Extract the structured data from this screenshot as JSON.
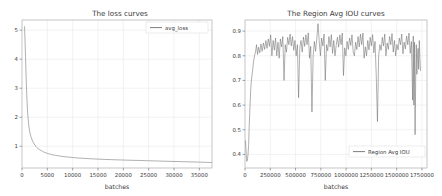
{
  "figure": {
    "background_color": "#ffffff",
    "line_color": "#6e6e6e",
    "grid_color": "#e9e9e9",
    "text_color": "#3a3a3a"
  },
  "chart_data": [
    {
      "type": "line",
      "panel": "left",
      "title": "The loss curves",
      "xlabel": "batches",
      "ylabel": "",
      "xlim": [
        0,
        37500
      ],
      "ylim": [
        0.25,
        5.35
      ],
      "grid": true,
      "legend_position": "upper right",
      "xticks": [
        0,
        5000,
        10000,
        15000,
        20000,
        25000,
        30000,
        35000
      ],
      "xticklabels": [
        "0",
        "5000",
        "10000",
        "15000",
        "20000",
        "25000",
        "30000",
        "35000"
      ],
      "yticks": [
        1,
        2,
        3,
        4,
        5
      ],
      "yticklabels": [
        "1",
        "2",
        "3",
        "4",
        "5"
      ],
      "series": [
        {
          "name": "avg_loss",
          "color": "#6e6e6e",
          "x": [
            500,
            620,
            700,
            780,
            860,
            940,
            1020,
            1100,
            1200,
            1300,
            1400,
            1500,
            1650,
            1800,
            1950,
            2100,
            2300,
            2500,
            2700,
            2900,
            3100,
            3400,
            3700,
            4000,
            4300,
            4600,
            5000,
            5400,
            5800,
            6200,
            6600,
            7000,
            7500,
            8000,
            8500,
            9000,
            9500,
            10000,
            10600,
            11200,
            11800,
            12400,
            13000,
            13700,
            14400,
            15100,
            15800,
            16500,
            17300,
            18100,
            18900,
            19700,
            20500,
            21400,
            22300,
            23200,
            24100,
            25000,
            26000,
            27000,
            28000,
            29000,
            30000,
            31000,
            32000,
            33000,
            34000,
            35000,
            36000,
            37000,
            37400
          ],
          "values": [
            5.12,
            4.55,
            4.05,
            3.58,
            3.15,
            2.78,
            2.46,
            2.2,
            1.96,
            1.78,
            1.63,
            1.52,
            1.4,
            1.31,
            1.24,
            1.18,
            1.11,
            1.05,
            1.0,
            0.96,
            0.93,
            0.89,
            0.86,
            0.83,
            0.8,
            0.78,
            0.755,
            0.735,
            0.715,
            0.7,
            0.688,
            0.675,
            0.66,
            0.648,
            0.638,
            0.628,
            0.62,
            0.612,
            0.602,
            0.594,
            0.587,
            0.58,
            0.574,
            0.567,
            0.561,
            0.555,
            0.55,
            0.545,
            0.54,
            0.535,
            0.53,
            0.526,
            0.522,
            0.517,
            0.513,
            0.509,
            0.505,
            0.5,
            0.495,
            0.49,
            0.485,
            0.48,
            0.476,
            0.471,
            0.466,
            0.462,
            0.457,
            0.452,
            0.447,
            0.442,
            0.44
          ]
        }
      ]
    },
    {
      "type": "line",
      "panel": "right",
      "title": "The Region Avg IOU curves",
      "xlabel": "batches",
      "ylabel": "",
      "xlim": [
        0,
        1800000
      ],
      "ylim": [
        0.345,
        0.945
      ],
      "grid": true,
      "legend_position": "lower right",
      "xticks": [
        0,
        250000,
        500000,
        750000,
        1000000,
        1250000,
        1500000,
        1750000
      ],
      "xticklabels": [
        "0",
        "250000",
        "500000",
        "750000",
        "1000000",
        "1250000",
        "1500000",
        "1750000"
      ],
      "yticks": [
        0.4,
        0.5,
        0.6,
        0.7,
        0.8,
        0.9
      ],
      "yticklabels": [
        "0.4",
        "0.5",
        "0.6",
        "0.7",
        "0.8",
        "0.9"
      ],
      "series": [
        {
          "name": "Region Avg IOU",
          "color": "#6e6e6e",
          "x": [
            5000,
            12000,
            18000,
            24000,
            30000,
            36000,
            42000,
            50000,
            58000,
            66000,
            74000,
            84000,
            94000,
            104000,
            114000,
            124000,
            134000,
            146000,
            158000,
            170000,
            182000,
            194000,
            206000,
            218000,
            230000,
            242000,
            254000,
            266000,
            278000,
            290000,
            302000,
            314000,
            326000,
            338000,
            350000,
            362000,
            374000,
            386000,
            398000,
            410000,
            422000,
            434000,
            446000,
            458000,
            470000,
            482000,
            494000,
            506000,
            518000,
            530000,
            542000,
            554000,
            566000,
            578000,
            590000,
            602000,
            614000,
            626000,
            638000,
            650000,
            662000,
            674000,
            686000,
            698000,
            710000,
            722000,
            734000,
            746000,
            758000,
            770000,
            782000,
            794000,
            806000,
            818000,
            830000,
            842000,
            854000,
            866000,
            878000,
            890000,
            902000,
            914000,
            926000,
            938000,
            950000,
            962000,
            974000,
            986000,
            998000,
            1010000,
            1022000,
            1034000,
            1046000,
            1058000,
            1070000,
            1082000,
            1094000,
            1106000,
            1118000,
            1130000,
            1142000,
            1154000,
            1166000,
            1178000,
            1190000,
            1202000,
            1214000,
            1226000,
            1238000,
            1250000,
            1262000,
            1274000,
            1286000,
            1298000,
            1310000,
            1322000,
            1334000,
            1346000,
            1358000,
            1370000,
            1382000,
            1394000,
            1406000,
            1418000,
            1430000,
            1442000,
            1454000,
            1466000,
            1478000,
            1490000,
            1502000,
            1514000,
            1526000,
            1538000,
            1550000,
            1562000,
            1574000,
            1586000,
            1598000,
            1610000,
            1622000,
            1634000,
            1646000,
            1658000,
            1664000,
            1670000,
            1676000,
            1682000,
            1688000,
            1694000,
            1700000,
            1706000,
            1712000,
            1718000,
            1724000,
            1730000,
            1736000
          ],
          "values": [
            0.455,
            0.4,
            0.372,
            0.378,
            0.4,
            0.44,
            0.52,
            0.6,
            0.675,
            0.71,
            0.735,
            0.775,
            0.8,
            0.815,
            0.845,
            0.805,
            0.835,
            0.812,
            0.848,
            0.818,
            0.852,
            0.826,
            0.862,
            0.83,
            0.868,
            0.838,
            0.885,
            0.8,
            0.862,
            0.823,
            0.872,
            0.8,
            0.855,
            0.79,
            0.868,
            0.836,
            0.878,
            0.7,
            0.845,
            0.815,
            0.875,
            0.845,
            0.888,
            0.84,
            0.878,
            0.822,
            0.862,
            0.8,
            0.845,
            0.63,
            0.832,
            0.862,
            0.815,
            0.876,
            0.838,
            0.885,
            0.845,
            0.893,
            0.79,
            0.838,
            0.572,
            0.8,
            0.858,
            0.818,
            0.87,
            0.93,
            0.858,
            0.8,
            0.872,
            0.84,
            0.888,
            0.7,
            0.845,
            0.82,
            0.878,
            0.836,
            0.886,
            0.81,
            0.862,
            0.8,
            0.842,
            0.875,
            0.835,
            0.885,
            0.845,
            0.892,
            0.72,
            0.832,
            0.8,
            0.858,
            0.826,
            0.872,
            0.842,
            0.885,
            0.815,
            0.8,
            0.855,
            0.825,
            0.878,
            0.836,
            0.888,
            0.845,
            0.892,
            0.79,
            0.836,
            0.8,
            0.862,
            0.824,
            0.875,
            0.84,
            0.886,
            0.812,
            0.858,
            0.72,
            0.533,
            0.8,
            0.845,
            0.822,
            0.875,
            0.84,
            0.888,
            0.8,
            0.852,
            0.826,
            0.878,
            0.845,
            0.89,
            0.815,
            0.862,
            0.8,
            0.846,
            0.824,
            0.872,
            0.845,
            0.888,
            0.808,
            0.855,
            0.828,
            0.88,
            0.845,
            0.892,
            0.81,
            0.858,
            0.62,
            0.88,
            0.6,
            0.855,
            0.48,
            0.7,
            0.845,
            0.725,
            0.8,
            0.83,
            0.745,
            0.862,
            0.79,
            0.74
          ]
        }
      ]
    }
  ]
}
